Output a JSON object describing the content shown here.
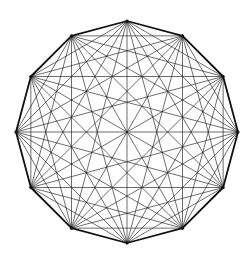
{
  "figure": {
    "shape": "regular-dodecagon-complete-graph",
    "vertex_count": 12,
    "center": [
      127,
      132
    ],
    "radius": 111,
    "start_angle_deg": -90,
    "draw_all_diagonals": true,
    "draw_perimeter": true,
    "colors": {
      "background": "#ffffff",
      "edge": "#111111",
      "diagonal": "#1a1a1a"
    }
  }
}
